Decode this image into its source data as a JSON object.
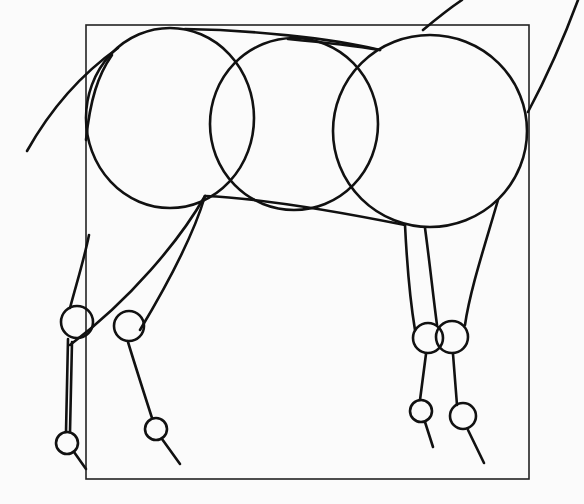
{
  "drawing": {
    "subject": "horse body construction sketch",
    "paper_color": "#fbfbfb",
    "ink_color": "#111111",
    "frame": {
      "x1": 86,
      "y1": 25,
      "x2": 529,
      "y2": 479
    },
    "body_circles": [
      {
        "name": "chest-circle",
        "cx": 170,
        "cy": 118,
        "rx": 84,
        "ry": 90
      },
      {
        "name": "barrel-circle",
        "cx": 294,
        "cy": 124,
        "rx": 84,
        "ry": 86
      },
      {
        "name": "hindquarter-circle",
        "cx": 430,
        "cy": 131,
        "rx": 97,
        "ry": 96
      }
    ],
    "strokes": [
      {
        "name": "neck-curve",
        "d": "M 27 151 C 50 110, 80 75, 118 48"
      },
      {
        "name": "neck-front-line",
        "d": "M 112 55 C 98 75, 90 100, 86 140"
      },
      {
        "name": "back-line",
        "d": "M 185 29 C 250 30, 330 38, 380 50"
      },
      {
        "name": "topline-to-hip",
        "d": "M 288 39 C 320 42, 350 45, 380 50"
      },
      {
        "name": "belly-line",
        "d": "M 205 196 C 260 198, 330 210, 405 225"
      },
      {
        "name": "tail-line",
        "d": "M 423 30 C 435 20, 450 8, 462 0"
      },
      {
        "name": "rump-line",
        "d": "M 528 112 C 545 80, 565 35, 578 0"
      },
      {
        "name": "front-leg-upper-back",
        "d": "M 89 235 C 84 260, 76 285, 70 308"
      },
      {
        "name": "front-leg-arm",
        "d": "M 205 196 C 180 240, 130 300, 70 345"
      },
      {
        "name": "front-leg-2-upper",
        "d": "M 205 196 C 195 230, 170 280, 140 330"
      },
      {
        "name": "front-leg-1-cannon",
        "d": "M 68 339 L 66 432"
      },
      {
        "name": "front-leg-1-pastern",
        "d": "M 74 452 L 86 469"
      },
      {
        "name": "front-leg-2-cannon",
        "d": "M 128 342 C 135 365, 143 390, 152 418"
      },
      {
        "name": "front-leg-2-pastern",
        "d": "M 162 439 L 180 464"
      },
      {
        "name": "hind-leg-1-upper",
        "d": "M 405 225 C 407 265, 410 300, 415 330"
      },
      {
        "name": "hind-leg-2-upper",
        "d": "M 425 228 C 430 265, 433 295, 437 325"
      },
      {
        "name": "hind-leg-3-upper",
        "d": "M 498 200 C 485 245, 470 290, 465 325"
      },
      {
        "name": "hind-leg-1-cannon",
        "d": "M 426 354 L 420 400"
      },
      {
        "name": "hind-leg-1-pastern",
        "d": "M 425 422 L 433 447"
      },
      {
        "name": "hind-leg-2-cannon",
        "d": "M 453 354 L 457 405"
      },
      {
        "name": "hind-leg-2-pastern",
        "d": "M 468 430 L 484 463"
      },
      {
        "name": "front-leg-1-cannon-2",
        "d": "M 72 342 L 70 432"
      }
    ],
    "joints": [
      {
        "name": "front-knee-1",
        "cx": 77,
        "cy": 322,
        "r": 16
      },
      {
        "name": "front-knee-2",
        "cx": 129,
        "cy": 326,
        "r": 15
      },
      {
        "name": "front-fetlock-1",
        "cx": 67,
        "cy": 443,
        "r": 11
      },
      {
        "name": "front-fetlock-2",
        "cx": 156,
        "cy": 429,
        "r": 11
      },
      {
        "name": "hind-hock-1",
        "cx": 428,
        "cy": 338,
        "r": 15
      },
      {
        "name": "hind-hock-2",
        "cx": 452,
        "cy": 337,
        "r": 16
      },
      {
        "name": "hind-fetlock-1",
        "cx": 421,
        "cy": 411,
        "r": 11
      },
      {
        "name": "hind-fetlock-2",
        "cx": 463,
        "cy": 416,
        "r": 13
      }
    ]
  }
}
